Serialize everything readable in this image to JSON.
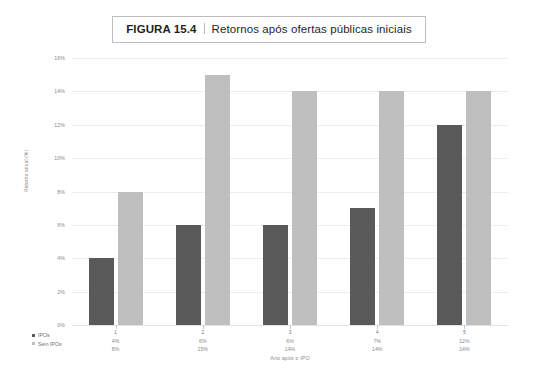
{
  "figure": {
    "number": "FIGURA 15.4",
    "separator": "|",
    "caption": "Retornos após ofertas públicas iniciais"
  },
  "legend": {
    "position": "bottom-left",
    "items": [
      {
        "label": "IPOs",
        "color": "#595959"
      },
      {
        "label": "Sem IPOs",
        "color": "#bfbfbf"
      }
    ]
  },
  "axes": {
    "ylabel": "Retorno anual (%)",
    "xlabel": "Ano após o IPO",
    "yticks": [
      "16%",
      "14%",
      "12%",
      "10%",
      "8%",
      "6%",
      "4%",
      "2%",
      "0%"
    ]
  },
  "chart_data": {
    "type": "bar",
    "title": "Retornos após ofertas públicas iniciais",
    "xlabel": "Ano após o IPO",
    "ylabel": "Retorno anual (%)",
    "categories": [
      "1",
      "2",
      "3",
      "4",
      "5"
    ],
    "ylim": [
      0,
      16
    ],
    "ytick_step": 2,
    "grid": true,
    "legend_position": "bottom-left",
    "series": [
      {
        "name": "IPOs",
        "color": "#595959",
        "values": [
          4,
          6,
          6,
          7,
          12
        ],
        "labels": [
          "4%",
          "6%",
          "6%",
          "7%",
          "12%"
        ]
      },
      {
        "name": "Sem IPOs",
        "color": "#bfbfbf",
        "values": [
          8,
          15,
          14,
          14,
          14
        ],
        "labels": [
          "8%",
          "15%",
          "14%",
          "14%",
          "14%"
        ]
      }
    ]
  }
}
